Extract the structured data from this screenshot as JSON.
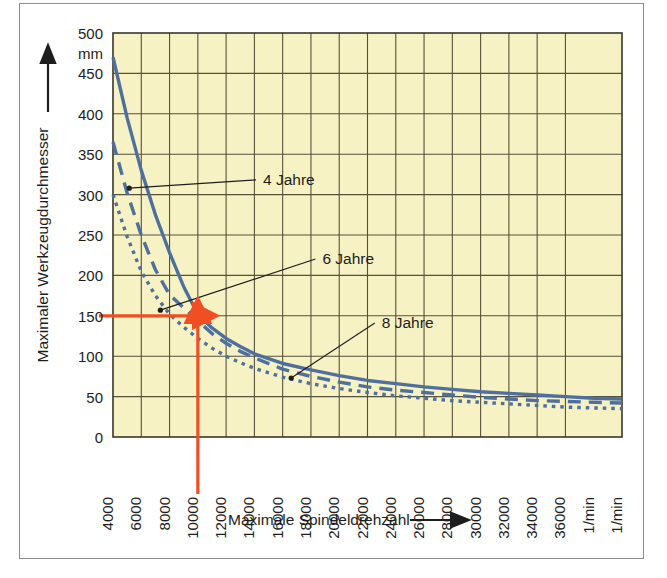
{
  "figure": {
    "background_color": "#ffffff",
    "frame_border_color": "#8c8c8c",
    "plot_background_color": "#f7f2c4",
    "grid_color": "#56513a",
    "curve_color": "#4f6f9f",
    "marker_color": "#f04e23",
    "text_color": "#1d1d1d"
  },
  "chart_data": {
    "type": "line",
    "title": "",
    "subtitle": "",
    "xlabel": "Maximale Spindeldrehzahl",
    "ylabel": "Maximaler Werkzeugdurchmesser",
    "y_unit": "mm",
    "x_unit": "1/min",
    "xlim": [
      4000,
      40000
    ],
    "ylim": [
      0,
      500
    ],
    "xticks": [
      4000,
      6000,
      8000,
      10000,
      12000,
      14000,
      16000,
      18000,
      20000,
      22000,
      24000,
      26000,
      28000,
      30000,
      32000,
      34000,
      36000,
      40000
    ],
    "xtick_labels": [
      "4000",
      "6000",
      "8000",
      "10000",
      "12000",
      "14000",
      "16000",
      "18000",
      "20000",
      "22000",
      "24000",
      "26000",
      "28000",
      "30000",
      "32000",
      "34000",
      "36000",
      "1/min",
      "40000"
    ],
    "yticks": [
      0,
      50,
      100,
      150,
      200,
      250,
      300,
      350,
      400,
      450,
      500
    ],
    "ytick_labels": [
      "0",
      "50",
      "100",
      "150",
      "200",
      "250",
      "300",
      "350",
      "400",
      "450",
      "500"
    ],
    "grid": true,
    "legend_position": "inline-annotations",
    "series": [
      {
        "name": "4 Jahre",
        "style": "solid",
        "x": [
          4000,
          5000,
          6000,
          7000,
          8000,
          9000,
          10000,
          11000,
          12000,
          13000,
          14000,
          16000,
          18000,
          20000,
          22000,
          24000,
          26000,
          28000,
          30000,
          32000,
          34000,
          36000,
          38000,
          40000
        ],
        "y": [
          470,
          395,
          330,
          275,
          228,
          186,
          152,
          135,
          122,
          112,
          103,
          91,
          83,
          76,
          70,
          66,
          62,
          59,
          56,
          54,
          52,
          50,
          48,
          47
        ]
      },
      {
        "name": "6 Jahre",
        "style": "dashed",
        "x": [
          4000,
          5000,
          6000,
          7000,
          8000,
          9000,
          10000,
          11000,
          12000,
          13000,
          14000,
          16000,
          18000,
          20000,
          22000,
          24000,
          26000,
          28000,
          30000,
          32000,
          34000,
          36000,
          38000,
          40000
        ],
        "y": [
          365,
          302,
          250,
          207,
          176,
          160,
          144,
          128,
          116,
          106,
          98,
          84,
          75,
          68,
          62,
          58,
          55,
          52,
          49,
          47,
          45,
          44,
          43,
          42
        ]
      },
      {
        "name": "8 Jahre",
        "style": "dotted",
        "x": [
          4000,
          5000,
          6000,
          7000,
          8000,
          9000,
          10000,
          11000,
          12000,
          13000,
          14000,
          16000,
          18000,
          20000,
          22000,
          24000,
          26000,
          28000,
          30000,
          32000,
          34000,
          36000,
          38000,
          40000
        ],
        "y": [
          300,
          248,
          205,
          175,
          152,
          136,
          122,
          110,
          100,
          92,
          85,
          74,
          66,
          60,
          55,
          51,
          48,
          45,
          43,
          41,
          39,
          37,
          36,
          35
        ]
      }
    ],
    "annotations": [
      {
        "name": "4 Jahre",
        "label": "4 Jahre",
        "label_x": 14400,
        "label_y": 312,
        "point_x": 5150,
        "point_y": 308
      },
      {
        "name": "6 Jahre",
        "label": "6 Jahre",
        "label_x": 18600,
        "label_y": 214,
        "point_x": 7350,
        "point_y": 157
      },
      {
        "name": "8 Jahre",
        "label": "8 Jahre",
        "label_x": 22800,
        "label_y": 135,
        "point_x": 16600,
        "point_y": 73
      }
    ],
    "readout_marker": {
      "x_value": 10000,
      "y_value": 150,
      "color": "#f04e23",
      "description": "Ablesemarkierung bei 10000 1/min und 150 mm"
    }
  }
}
